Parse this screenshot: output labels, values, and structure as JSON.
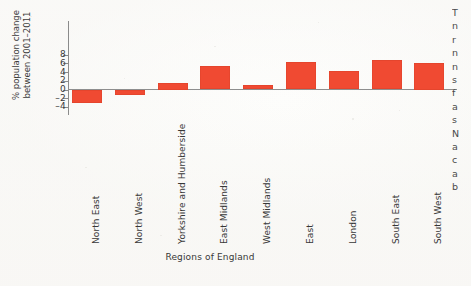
{
  "chart_data": {
    "type": "bar",
    "title": "",
    "subtitle": "",
    "xlabel": "Regions of England",
    "ylabel": "% population change between 2001–2011",
    "ylabel_lines": [
      "% population change",
      "between 2001–2011"
    ],
    "categories": [
      "North East",
      "North West",
      "Yorkshire and Humberside",
      "East Midlands",
      "West Midlands",
      "East",
      "London",
      "South East",
      "South West"
    ],
    "values": [
      -3.0,
      -1.3,
      1.5,
      5.3,
      1.0,
      6.4,
      4.3,
      6.7,
      6.2
    ],
    "ylim": [
      -4,
      8
    ],
    "yticks": [
      8,
      6,
      4,
      2,
      0,
      -2,
      -4
    ],
    "ytick_labels": [
      "8",
      "6",
      "4",
      "2",
      "0",
      "–2",
      "–4"
    ],
    "grid": false,
    "legend": "none",
    "bar_color": "#f04a32",
    "axis_color": "#8b8b8b",
    "zero_line_color": "#8e8e8e",
    "orientation": "vertical",
    "category_label_rotation": -90
  },
  "side_column": {
    "truncated_lines": [
      "T",
      "n",
      "r",
      "n",
      "n",
      "s",
      "f",
      "a",
      "s",
      "N",
      "a",
      "c",
      "a",
      "b"
    ]
  }
}
